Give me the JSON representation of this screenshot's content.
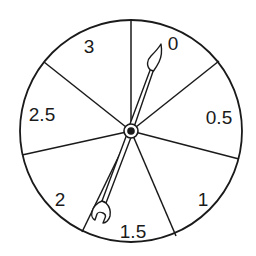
{
  "diagram": {
    "type": "spinner",
    "colors": {
      "stroke": "#1a1a1a",
      "background": "#ffffff"
    },
    "center": [
      131,
      131
    ],
    "radius": 110,
    "sector_lines": [
      [
        131,
        17
      ],
      [
        218,
        62
      ],
      [
        238,
        158
      ],
      [
        176,
        236
      ],
      [
        82,
        232
      ],
      [
        22,
        155
      ],
      [
        44,
        62
      ]
    ],
    "sectors": [
      {
        "label": "0",
        "x": 173,
        "y": 50
      },
      {
        "label": "0.5",
        "x": 218,
        "y": 124
      },
      {
        "label": "1",
        "x": 203,
        "y": 205
      },
      {
        "label": "1.5",
        "x": 133,
        "y": 237
      },
      {
        "label": "2",
        "x": 59,
        "y": 205
      },
      {
        "label": "2.5",
        "x": 42,
        "y": 120
      },
      {
        "label": "3",
        "x": 89,
        "y": 52
      }
    ],
    "pointer": {
      "tip": [
        161,
        44
      ],
      "tail": [
        95,
        215
      ],
      "points_to": "0"
    }
  }
}
